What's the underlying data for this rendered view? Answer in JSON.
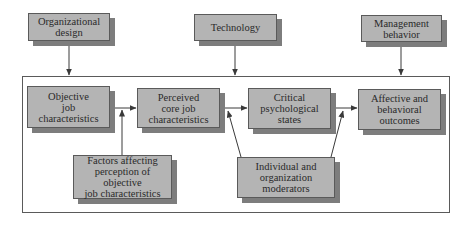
{
  "diagram": {
    "type": "flowchart",
    "influences": [
      {
        "id": "org",
        "label": "Organizational\ndesign"
      },
      {
        "id": "tech",
        "label": "Technology"
      },
      {
        "id": "mgmt",
        "label": "Management\nbehavior"
      }
    ],
    "main_chain": [
      {
        "id": "objective",
        "label": "Objective\njob\ncharacteristics"
      },
      {
        "id": "perceived",
        "label": "Perceived\ncore job\ncharacteristics"
      },
      {
        "id": "critical",
        "label": "Critical\npsychological\nstates"
      },
      {
        "id": "outcomes",
        "label": "Affective and\nbehavioral\noutcomes"
      }
    ],
    "moderators": [
      {
        "id": "factors",
        "label": "Factors affecting\nperception of objective\njob characteristics"
      },
      {
        "id": "individual",
        "label": "Individual and\norganization\nmoderators"
      }
    ],
    "edges": [
      {
        "from": "org",
        "to": "container"
      },
      {
        "from": "tech",
        "to": "container"
      },
      {
        "from": "mgmt",
        "to": "container"
      },
      {
        "from": "objective",
        "to": "perceived"
      },
      {
        "from": "perceived",
        "to": "critical"
      },
      {
        "from": "critical",
        "to": "outcomes"
      },
      {
        "from": "factors",
        "to": "objective-perceived-edge"
      },
      {
        "from": "individual",
        "to": "perceived-critical-edge"
      },
      {
        "from": "individual",
        "to": "critical-outcomes-edge"
      }
    ],
    "colors": {
      "box_fill": "#b4b4b4",
      "box_shadow": "#7d7d7d",
      "line": "#3a3a3a"
    }
  }
}
